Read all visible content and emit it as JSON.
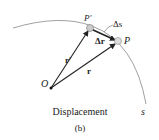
{
  "figure": {
    "caption": "Displacement",
    "sublabel": "(b)",
    "labels": {
      "origin": "O",
      "point_prime": "P'",
      "point": "P",
      "delta_s": "Δs",
      "delta_r": "Δr",
      "r_prime": "r'",
      "r": "r",
      "path": "s"
    },
    "colors": {
      "line": "#222222",
      "path": "#888888",
      "particle": "#bbbbbb"
    }
  }
}
